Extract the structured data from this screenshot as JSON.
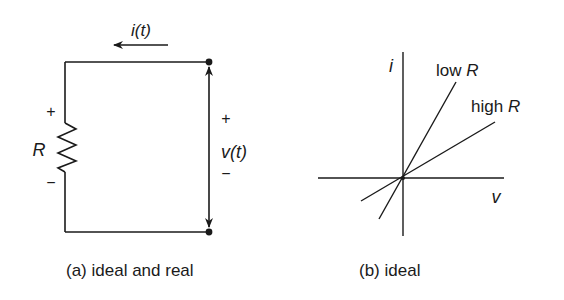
{
  "panel_a": {
    "caption": "(a) ideal and real",
    "current_label": "i(t)",
    "resistor_label": "R",
    "resistor_plus": "+",
    "resistor_minus": "−",
    "voltage_label": "v(t)",
    "voltage_plus": "+",
    "voltage_minus": "−"
  },
  "panel_b": {
    "caption": "(b) ideal",
    "y_axis_label": "i",
    "x_axis_label": "v",
    "lines": [
      {
        "label_prefix": "low ",
        "label_var": "R"
      },
      {
        "label_prefix": "high ",
        "label_var": "R"
      }
    ]
  },
  "colors": {
    "ink": "#1a1a1a",
    "background": "#ffffff"
  }
}
